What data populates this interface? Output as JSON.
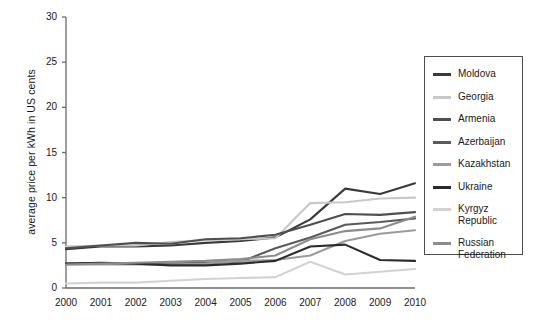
{
  "chart_data": {
    "type": "line",
    "title": "",
    "xlabel": "",
    "ylabel": "average price per kWh in US cents",
    "x": [
      2000,
      2001,
      2002,
      2003,
      2004,
      2005,
      2006,
      2007,
      2008,
      2009,
      2010
    ],
    "xtick_labels": [
      "2000",
      "2001",
      "2002",
      "2003",
      "2004",
      "2005",
      "2006",
      "2007",
      "2008",
      "2009",
      "2010"
    ],
    "ytick_labels": [
      "0",
      "5",
      "10",
      "15",
      "20",
      "25",
      "30"
    ],
    "ytick_values": [
      0,
      5,
      10,
      15,
      20,
      25,
      30
    ],
    "ylim": [
      0,
      30
    ],
    "xlim": [
      2000,
      2010
    ],
    "grid": false,
    "legend_position": "right-outside",
    "series": [
      {
        "name": "Moldova",
        "color": "#3a3a3a",
        "values": [
          4.3,
          4.6,
          4.6,
          4.7,
          5.0,
          5.2,
          5.6,
          7.6,
          11.0,
          10.4,
          11.6
        ]
      },
      {
        "name": "Georgia",
        "color": "#c8c8c8",
        "values": [
          4.6,
          4.7,
          4.7,
          5.1,
          5.3,
          5.4,
          5.5,
          9.4,
          9.5,
          9.9,
          10.0
        ]
      },
      {
        "name": "Armenia",
        "color": "#4f4f4f",
        "values": [
          4.4,
          4.7,
          5.0,
          4.9,
          5.4,
          5.5,
          5.9,
          7.0,
          8.2,
          8.1,
          8.4
        ]
      },
      {
        "name": "Azerbaijan",
        "color": "#5a5a5a",
        "values": [
          2.7,
          2.7,
          2.7,
          2.7,
          2.8,
          2.9,
          4.4,
          5.6,
          7.0,
          7.3,
          7.7
        ]
      },
      {
        "name": "Kazakhstan",
        "color": "#9b9b9b",
        "values": [
          2.6,
          2.6,
          2.6,
          2.6,
          2.7,
          3.0,
          3.1,
          3.6,
          5.2,
          6.0,
          6.4
        ]
      },
      {
        "name": "Ukraine",
        "color": "#2b2b2b",
        "values": [
          2.7,
          2.8,
          2.7,
          2.5,
          2.5,
          2.7,
          3.0,
          4.6,
          4.8,
          3.1,
          3.0
        ]
      },
      {
        "name": "Kyrgyz\nRepublic",
        "color": "#d2d2d2",
        "values": [
          0.5,
          0.6,
          0.6,
          0.8,
          1.0,
          1.1,
          1.2,
          2.9,
          1.5,
          1.8,
          2.1
        ]
      },
      {
        "name": "Russian\nFederation",
        "color": "#8c8c8c",
        "values": [
          2.6,
          2.7,
          2.8,
          2.9,
          3.0,
          3.2,
          3.6,
          5.4,
          6.3,
          6.6,
          7.9
        ]
      }
    ]
  },
  "axes": {
    "y_axis_title": "average price per kWh in US cents"
  },
  "legend": {
    "entries": [
      {
        "label": "Moldova"
      },
      {
        "label": "Georgia"
      },
      {
        "label": "Armenia"
      },
      {
        "label": "Azerbaijan"
      },
      {
        "label": "Kazakhstan"
      },
      {
        "label": "Ukraine"
      },
      {
        "label": "Kyrgyz\nRepublic"
      },
      {
        "label": "Russian\nFederation"
      }
    ]
  },
  "colors": {
    "axis": "#6b6b6b",
    "text": "#1a1a1a",
    "legend_border": "#4d4d4d",
    "background": "#ffffff"
  }
}
